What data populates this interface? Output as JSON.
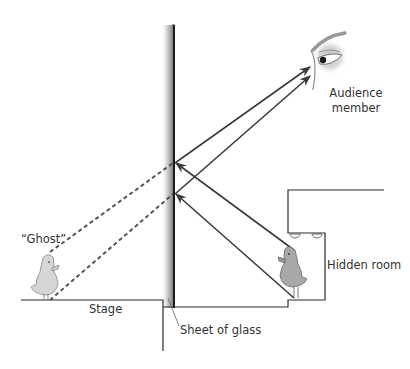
{
  "diagram": {
    "type": "Pepper's ghost illusion",
    "labels": {
      "audience_line1": "Audience",
      "audience_line2": "member",
      "ghost": "“Ghost”",
      "stage": "Stage",
      "glass": "Sheet of glass",
      "hidden_room": "Hidden room"
    },
    "colors": {
      "line": "#2b2b2b",
      "ray": "#3a3a3a",
      "dashed": "#555555",
      "glass_dark": "#1a1a1a",
      "glass_light": "#f2f2f2",
      "duck_body": "#bdbdbd",
      "duck_ghost": "#d6d6d6"
    },
    "elements": [
      "sheet of glass at angle",
      "real duck in hidden room",
      "ghost duck reflection on stage",
      "two light rays from hidden duck reflecting off glass to audience eye",
      "dashed virtual rays from ghost image to glass"
    ]
  }
}
